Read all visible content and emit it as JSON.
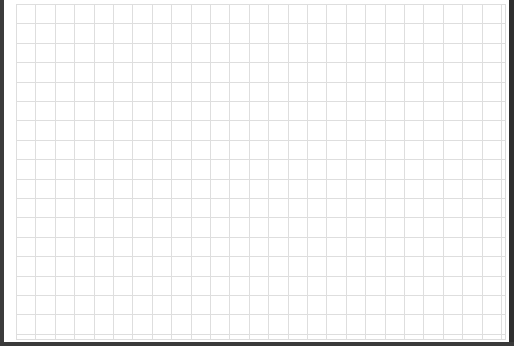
{
  "canvas": {
    "type": "grid-paper",
    "background_color": "#ffffff",
    "grid_color": "#dedede",
    "border_color": "#3a3a3a",
    "cell_size_px": 19.4,
    "columns": 25,
    "rows": 17
  }
}
